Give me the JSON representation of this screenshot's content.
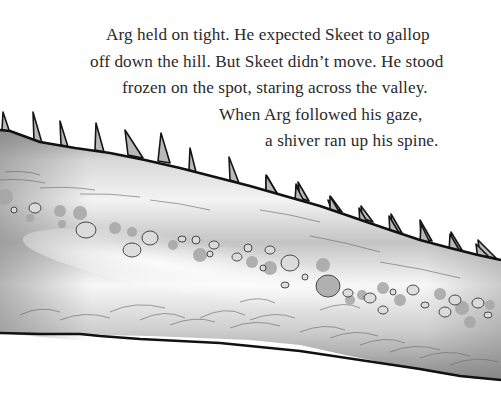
{
  "story": {
    "lines": [
      "Arg held on tight. He expected Skeet to gallop",
      "off down the hill. But Skeet didn’t move. He stood",
      "frozen on the spot, staring across the valley.",
      "When Arg followed his gaze,",
      "a shiver ran up his spine."
    ]
  },
  "illustration": {
    "subject": "spiked-creature-back",
    "style": "grayscale ink and wash",
    "colors": {
      "outline": "#111111",
      "body_dark": "#8c8c8c",
      "body_light": "#f4f4f4",
      "spots": "#a9a9a9",
      "spike_fill": "#b9b9b9"
    },
    "spike_count": 19
  }
}
